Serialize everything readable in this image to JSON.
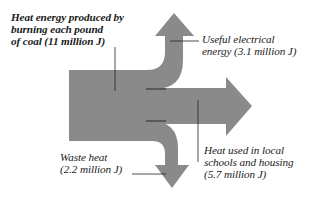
{
  "diagram": {
    "type": "sankey-energy-flow",
    "flow_color": "#8a8a8a",
    "input": {
      "lines": [
        "Heat energy produced by",
        "burning each pound",
        "of coal (11 million J)"
      ],
      "value_million_J": 11
    },
    "outputs": [
      {
        "id": "electrical",
        "lines": [
          "Useful electrical",
          "energy (3.1 million J)"
        ],
        "value_million_J": 3.1,
        "direction": "up"
      },
      {
        "id": "schools",
        "lines": [
          "Heat used in local",
          "schools and housing",
          "(5.7 million J)"
        ],
        "value_million_J": 5.7,
        "direction": "right"
      },
      {
        "id": "waste",
        "lines": [
          "Waste heat",
          "(2.2 million J)"
        ],
        "value_million_J": 2.2,
        "direction": "down"
      }
    ]
  }
}
